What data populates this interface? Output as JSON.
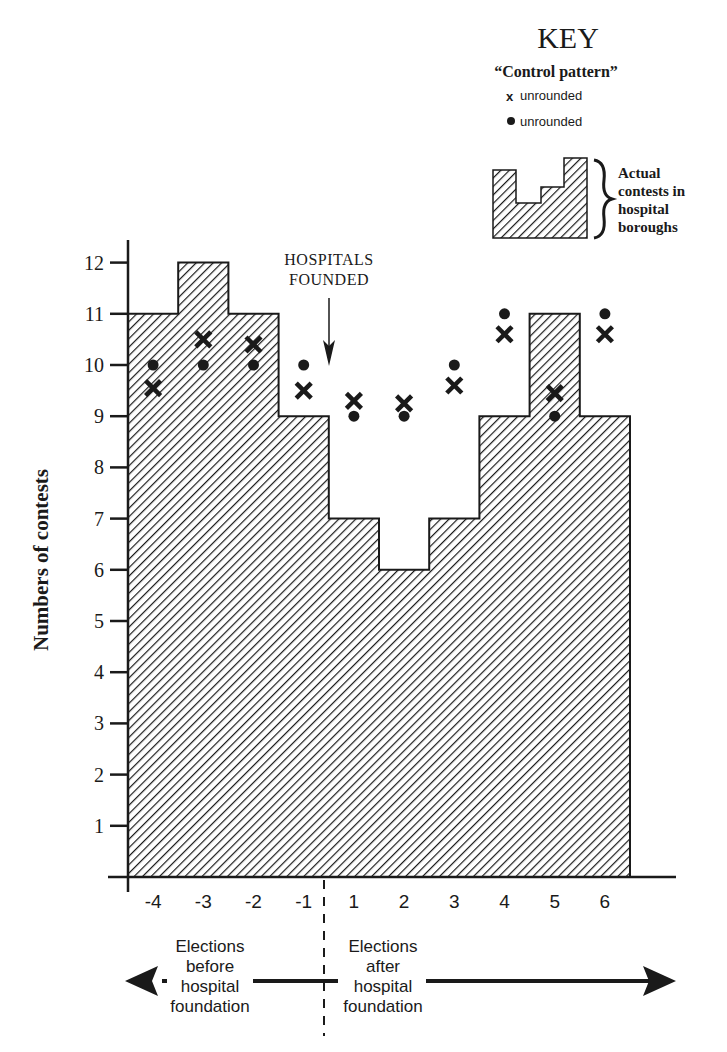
{
  "chart_data": {
    "type": "bar",
    "subtype": "step histogram with overlaid markers",
    "title": "",
    "xlabel": "",
    "ylabel": "Numbers of contests",
    "ylim": [
      0,
      12
    ],
    "yticks": [
      1,
      2,
      3,
      4,
      5,
      6,
      7,
      8,
      9,
      10,
      11,
      12
    ],
    "categories": [
      "-4",
      "-3",
      "-2",
      "-1",
      "1",
      "2",
      "3",
      "4",
      "5",
      "6"
    ],
    "grid": false,
    "legend_position": "top-right",
    "series": [
      {
        "name": "Actual contests in hospital boroughs",
        "style": "hatched-bars",
        "values": [
          11,
          12,
          11,
          9,
          7,
          6,
          7,
          9,
          11,
          9
        ]
      },
      {
        "name": "Control pattern (x unrounded)",
        "style": "x-marker",
        "values": [
          9.55,
          10.5,
          10.4,
          9.5,
          9.3,
          9.25,
          9.6,
          10.6,
          9.45,
          10.6
        ]
      },
      {
        "name": "Control pattern (• unrounded)",
        "style": "dot-marker",
        "values": [
          10,
          10,
          10,
          10,
          9,
          9,
          10,
          11,
          9,
          11
        ]
      }
    ],
    "annotations": [
      {
        "text_lines": [
          "HOSPITALS",
          "FOUNDED"
        ],
        "points_to": "boundary between -1 and 1"
      }
    ],
    "period_labels": {
      "before": [
        "Elections",
        "before",
        "hospital",
        "foundation"
      ],
      "after": [
        "Elections",
        "after",
        "hospital",
        "foundation"
      ]
    }
  },
  "key": {
    "title": "KEY",
    "subtitle": "“Control pattern”",
    "x_marker_glyph": "x",
    "x_item_label": "unrounded",
    "dot_item_label": "unrounded",
    "hatch_desc_lines": [
      "Actual",
      "contests in",
      "hospital",
      "boroughs"
    ]
  },
  "colors": {
    "ink": "#1a1a1a",
    "background": "#ffffff"
  }
}
